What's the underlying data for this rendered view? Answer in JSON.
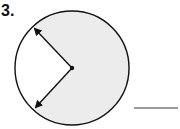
{
  "problem": {
    "number_label": "3.",
    "figure": "circle-with-shaded-sector",
    "answer_blank": "",
    "colors": {
      "shaded_fill": "#ececec",
      "stroke": "#111111"
    }
  }
}
